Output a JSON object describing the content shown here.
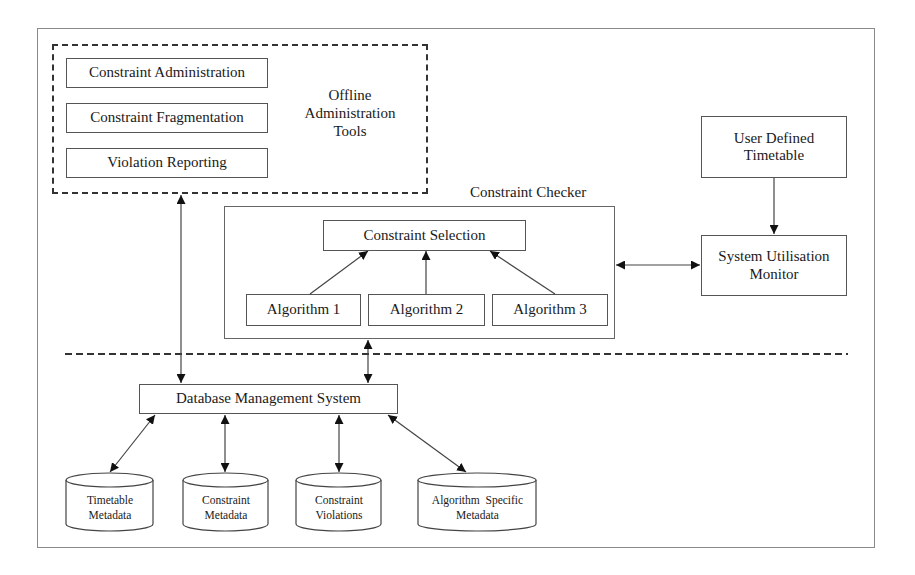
{
  "diagram": {
    "type": "system-architecture",
    "offline_tools": {
      "group_label": "Offline Administration Tools",
      "group_label_lines": [
        "Offline",
        "Administration",
        "Tools"
      ],
      "items": [
        {
          "label": "Constraint Administration"
        },
        {
          "label": "Constraint Fragmentation"
        },
        {
          "label": "Violation Reporting"
        }
      ]
    },
    "constraint_checker": {
      "title": "Constraint Checker",
      "selection": {
        "label": "Constraint Selection"
      },
      "algorithms": [
        {
          "label": "Algorithm 1"
        },
        {
          "label": "Algorithm 2"
        },
        {
          "label": "Algorithm 3"
        }
      ]
    },
    "user_timetable": {
      "label": "User Defined Timetable",
      "lines": [
        "User Defined",
        "Timetable"
      ]
    },
    "system_monitor": {
      "label": "System Utilisation Monitor",
      "lines": [
        "System Utilisation",
        "Monitor"
      ]
    },
    "dbms": {
      "label": "Database Management System"
    },
    "data_stores": [
      {
        "label": "Timetable Metadata",
        "lines": [
          "Timetable",
          "Metadata"
        ]
      },
      {
        "label": "Constraint Metadata",
        "lines": [
          "Constraint",
          "Metadata"
        ]
      },
      {
        "label": "Constraint Violations",
        "lines": [
          "Constraint",
          "Violations"
        ]
      },
      {
        "label": "Algorithm Specific Metadata",
        "lines": [
          "Algorithm  Specific",
          "Metadata"
        ]
      }
    ],
    "edges": [
      {
        "from": "Offline Administration Tools",
        "to": "Database Management System",
        "direction": "both"
      },
      {
        "from": "Constraint Checker",
        "to": "Database Management System",
        "direction": "both"
      },
      {
        "from": "Constraint Checker",
        "to": "System Utilisation Monitor",
        "direction": "both"
      },
      {
        "from": "User Defined Timetable",
        "to": "System Utilisation Monitor",
        "direction": "forward"
      },
      {
        "from": "Algorithm 1",
        "to": "Constraint Selection",
        "direction": "forward"
      },
      {
        "from": "Algorithm 2",
        "to": "Constraint Selection",
        "direction": "forward"
      },
      {
        "from": "Algorithm 3",
        "to": "Constraint Selection",
        "direction": "forward"
      },
      {
        "from": "Database Management System",
        "to": "Timetable Metadata",
        "direction": "both"
      },
      {
        "from": "Database Management System",
        "to": "Constraint Metadata",
        "direction": "both"
      },
      {
        "from": "Database Management System",
        "to": "Constraint Violations",
        "direction": "both"
      },
      {
        "from": "Database Management System",
        "to": "Algorithm Specific Metadata",
        "direction": "both"
      }
    ],
    "colors": {
      "line": "#333333",
      "frame": "#8a8a8a",
      "background": "#ffffff"
    }
  }
}
